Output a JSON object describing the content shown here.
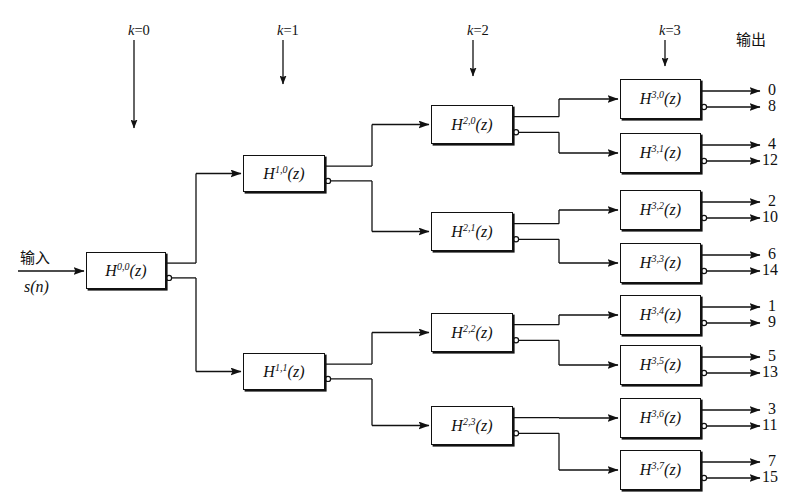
{
  "figure": {
    "type": "block-diagram",
    "canvas": {
      "width": 811,
      "height": 500
    },
    "line_color": "#111111",
    "background_color": "#ffffff"
  },
  "stage_labels": [
    {
      "id": "k0",
      "text": "k=0",
      "k": 0,
      "x": 128,
      "y": 22,
      "arrow_x": 134,
      "arrow_y1": 40,
      "arrow_y2": 128
    },
    {
      "id": "k1",
      "text": "k=1",
      "k": 1,
      "x": 277,
      "y": 22,
      "arrow_x": 283,
      "arrow_y1": 40,
      "arrow_y2": 84
    },
    {
      "id": "k2",
      "text": "k=2",
      "k": 2,
      "x": 467,
      "y": 22,
      "arrow_x": 473,
      "arrow_y1": 40,
      "arrow_y2": 76
    },
    {
      "id": "k3",
      "text": "k=3",
      "k": 3,
      "x": 659,
      "y": 22,
      "arrow_x": 665,
      "arrow_y1": 40,
      "arrow_y2": 66
    }
  ],
  "output_heading": {
    "text": "输出",
    "x": 736,
    "y": 28
  },
  "input": {
    "label": "输入",
    "signal": "s(n)",
    "label_x": 20,
    "label_y": 246,
    "signal_x": 24,
    "signal_y": 278,
    "arrow_x1": 18,
    "arrow_x2": 86,
    "arrow_y": 271
  },
  "boxes": [
    {
      "id": "h00",
      "name": "h-0-0",
      "base": "H",
      "sup": "0,0",
      "arg": "(z)",
      "x": 86,
      "y": 252,
      "w": 80,
      "h": 37
    },
    {
      "id": "h10",
      "name": "h-1-0",
      "base": "H",
      "sup": "1,0",
      "arg": "(z)",
      "x": 243,
      "y": 155,
      "w": 82,
      "h": 37
    },
    {
      "id": "h11",
      "name": "h-1-1",
      "base": "H",
      "sup": "1,1",
      "arg": "(z)",
      "x": 243,
      "y": 353,
      "w": 82,
      "h": 37
    },
    {
      "id": "h20",
      "name": "h-2-0",
      "base": "H",
      "sup": "2,0",
      "arg": "(z)",
      "x": 431,
      "y": 105,
      "w": 82,
      "h": 39
    },
    {
      "id": "h21",
      "name": "h-2-1",
      "base": "H",
      "sup": "2,1",
      "arg": "(z)",
      "x": 431,
      "y": 212,
      "w": 82,
      "h": 39
    },
    {
      "id": "h22",
      "name": "h-2-2",
      "base": "H",
      "sup": "2,2",
      "arg": "(z)",
      "x": 431,
      "y": 313,
      "w": 82,
      "h": 39
    },
    {
      "id": "h23",
      "name": "h-2-3",
      "base": "H",
      "sup": "2,3",
      "arg": "(z)",
      "x": 431,
      "y": 406,
      "w": 82,
      "h": 39
    },
    {
      "id": "h30",
      "name": "h-3-0",
      "base": "H",
      "sup": "3,0",
      "arg": "(z)",
      "x": 620,
      "y": 79,
      "w": 81,
      "h": 40
    },
    {
      "id": "h31",
      "name": "h-3-1",
      "base": "H",
      "sup": "3,1",
      "arg": "(z)",
      "x": 620,
      "y": 133,
      "w": 81,
      "h": 40
    },
    {
      "id": "h32",
      "name": "h-3-2",
      "base": "H",
      "sup": "3,2",
      "arg": "(z)",
      "x": 620,
      "y": 190,
      "w": 81,
      "h": 40
    },
    {
      "id": "h33",
      "name": "h-3-3",
      "base": "H",
      "sup": "3,3",
      "arg": "(z)",
      "x": 620,
      "y": 243,
      "w": 81,
      "h": 40
    },
    {
      "id": "h34",
      "name": "h-3-4",
      "base": "H",
      "sup": "3,4",
      "arg": "(z)",
      "x": 620,
      "y": 295,
      "w": 81,
      "h": 40
    },
    {
      "id": "h35",
      "name": "h-3-5",
      "base": "H",
      "sup": "3,5",
      "arg": "(z)",
      "x": 620,
      "y": 345,
      "w": 81,
      "h": 40
    },
    {
      "id": "h36",
      "name": "h-3-6",
      "base": "H",
      "sup": "3,6",
      "arg": "(z)",
      "x": 620,
      "y": 398,
      "w": 81,
      "h": 40
    },
    {
      "id": "h37",
      "name": "h-3-7",
      "base": "H",
      "sup": "3,7",
      "arg": "(z)",
      "x": 620,
      "y": 450,
      "w": 81,
      "h": 40
    }
  ],
  "connections": [
    {
      "from": "h00",
      "port": "top",
      "to": "h10",
      "mid_x": 196
    },
    {
      "from": "h00",
      "port": "bottom",
      "to": "h11",
      "mid_x": 196
    },
    {
      "from": "h10",
      "port": "top",
      "to": "h20",
      "mid_x": 372
    },
    {
      "from": "h10",
      "port": "bottom",
      "to": "h21",
      "mid_x": 372
    },
    {
      "from": "h11",
      "port": "top",
      "to": "h22",
      "mid_x": 372
    },
    {
      "from": "h11",
      "port": "bottom",
      "to": "h23",
      "mid_x": 372
    },
    {
      "from": "h20",
      "port": "top",
      "to": "h30",
      "mid_x": 559
    },
    {
      "from": "h20",
      "port": "bottom",
      "to": "h31",
      "mid_x": 559
    },
    {
      "from": "h21",
      "port": "top",
      "to": "h32",
      "mid_x": 559
    },
    {
      "from": "h21",
      "port": "bottom",
      "to": "h33",
      "mid_x": 559
    },
    {
      "from": "h22",
      "port": "top",
      "to": "h34",
      "mid_x": 559
    },
    {
      "from": "h22",
      "port": "bottom",
      "to": "h35",
      "mid_x": 559
    },
    {
      "from": "h23",
      "port": "top",
      "to": "h36",
      "mid_x": 559
    },
    {
      "from": "h23",
      "port": "bottom",
      "to": "h37",
      "mid_x": 559
    }
  ],
  "outputs": [
    {
      "from": "h30",
      "port": "top",
      "value": "0",
      "tip_x": 760,
      "text_x": 768
    },
    {
      "from": "h30",
      "port": "bottom",
      "value": "8",
      "tip_x": 760,
      "text_x": 768
    },
    {
      "from": "h31",
      "port": "top",
      "value": "4",
      "tip_x": 760,
      "text_x": 768
    },
    {
      "from": "h31",
      "port": "bottom",
      "value": "12",
      "tip_x": 760,
      "text_x": 762
    },
    {
      "from": "h32",
      "port": "top",
      "value": "2",
      "tip_x": 760,
      "text_x": 768
    },
    {
      "from": "h32",
      "port": "bottom",
      "value": "10",
      "tip_x": 760,
      "text_x": 762
    },
    {
      "from": "h33",
      "port": "top",
      "value": "6",
      "tip_x": 760,
      "text_x": 768
    },
    {
      "from": "h33",
      "port": "bottom",
      "value": "14",
      "tip_x": 760,
      "text_x": 762
    },
    {
      "from": "h34",
      "port": "top",
      "value": "1",
      "tip_x": 760,
      "text_x": 768
    },
    {
      "from": "h34",
      "port": "bottom",
      "value": "9",
      "tip_x": 760,
      "text_x": 768
    },
    {
      "from": "h35",
      "port": "top",
      "value": "5",
      "tip_x": 760,
      "text_x": 768
    },
    {
      "from": "h35",
      "port": "bottom",
      "value": "13",
      "tip_x": 760,
      "text_x": 762
    },
    {
      "from": "h36",
      "port": "top",
      "value": "3",
      "tip_x": 760,
      "text_x": 768
    },
    {
      "from": "h36",
      "port": "bottom",
      "value": "11",
      "tip_x": 760,
      "text_x": 762
    },
    {
      "from": "h37",
      "port": "top",
      "value": "7",
      "tip_x": 760,
      "text_x": 768
    },
    {
      "from": "h37",
      "port": "bottom",
      "value": "15",
      "tip_x": 760,
      "text_x": 762
    }
  ]
}
